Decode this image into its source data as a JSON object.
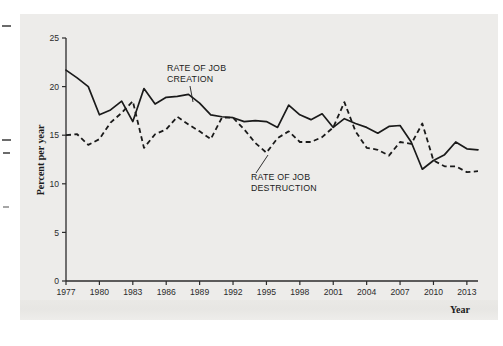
{
  "figure": {
    "background_color": "#edecea",
    "ink_color": "#1a1a1a"
  },
  "axes": {
    "y_title": "Percent per year",
    "x_title": "Year",
    "y_ticks": [
      "0",
      "5",
      "10",
      "15",
      "20",
      "25"
    ],
    "x_ticks": [
      "1977",
      "1980",
      "1983",
      "1986",
      "1989",
      "1992",
      "1995",
      "1998",
      "2001",
      "2004",
      "2007",
      "2010",
      "2013"
    ]
  },
  "annotations": {
    "creation": {
      "line1": "RATE OF JOB",
      "line2": "CREATION"
    },
    "destruction": {
      "line1": "RATE OF JOB",
      "line2": "DESTRUCTION"
    }
  },
  "chart_data": {
    "type": "line",
    "title": "",
    "subtitle": "",
    "xlabel": "Year",
    "ylabel": "Percent per year",
    "xlim": [
      1977,
      2014
    ],
    "ylim": [
      0,
      25
    ],
    "y_ticks": [
      0,
      5,
      10,
      15,
      20,
      25
    ],
    "x_ticks": [
      1977,
      1980,
      1983,
      1986,
      1989,
      1992,
      1995,
      1998,
      2001,
      2004,
      2007,
      2010,
      2013
    ],
    "grid": false,
    "legend": "inline-annotations",
    "x": [
      1977,
      1978,
      1979,
      1980,
      1981,
      1982,
      1983,
      1984,
      1985,
      1986,
      1987,
      1988,
      1989,
      1990,
      1991,
      1992,
      1993,
      1994,
      1995,
      1996,
      1997,
      1998,
      1999,
      2000,
      2001,
      2002,
      2003,
      2004,
      2005,
      2006,
      2007,
      2008,
      2009,
      2010,
      2011,
      2012,
      2013,
      2014
    ],
    "series": [
      {
        "name": "RATE OF JOB CREATION",
        "style": "solid",
        "values": [
          21.7,
          20.9,
          20.0,
          17.1,
          17.6,
          18.5,
          16.4,
          19.8,
          18.2,
          18.9,
          19.0,
          19.2,
          18.3,
          17.1,
          16.9,
          16.8,
          16.4,
          16.5,
          16.4,
          15.8,
          18.1,
          17.1,
          16.6,
          17.2,
          15.8,
          16.7,
          16.2,
          15.8,
          15.2,
          15.9,
          16.0,
          14.3,
          11.5,
          12.4,
          13.0,
          14.3,
          13.6,
          13.5
        ]
      },
      {
        "name": "RATE OF JOB DESTRUCTION",
        "style": "dashed",
        "values": [
          15.0,
          15.1,
          14.0,
          14.6,
          16.3,
          17.3,
          18.5,
          13.7,
          15.1,
          15.6,
          16.9,
          16.1,
          15.4,
          14.6,
          16.8,
          16.8,
          15.6,
          14.2,
          13.2,
          14.7,
          15.4,
          14.3,
          14.3,
          14.8,
          15.8,
          18.4,
          15.4,
          13.7,
          13.5,
          12.9,
          14.3,
          14.1,
          16.2,
          12.4,
          11.8,
          11.8,
          11.2,
          11.3
        ]
      }
    ]
  }
}
